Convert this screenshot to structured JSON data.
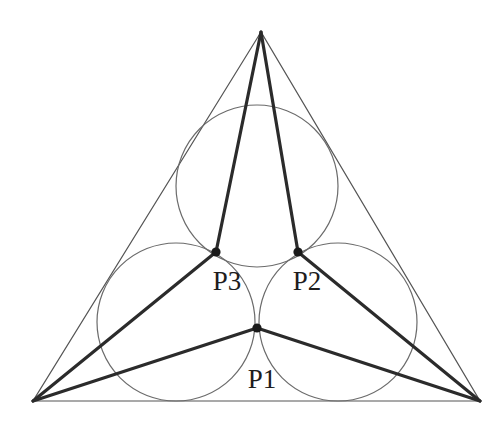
{
  "figure": {
    "canvas": {
      "width": 501,
      "height": 424,
      "background": "#ffffff"
    },
    "colors": {
      "thin_outline": "#555555",
      "circle_stroke": "#6b6b6b",
      "thick_segment": "#2b2b2b",
      "point_fill": "#1a1a1a",
      "label_text": "#1d1d1d"
    },
    "stroke_widths": {
      "thin_outline": 1.2,
      "circle": 1.2,
      "thick_segment": 3.2
    },
    "triangle": {
      "name": "outer-triangle",
      "vertices": [
        {
          "name": "apex",
          "x": 261,
          "y": 32
        },
        {
          "name": "bottom-left",
          "x": 33,
          "y": 401
        },
        {
          "name": "bottom-right",
          "x": 480,
          "y": 401
        }
      ]
    },
    "circles": [
      {
        "name": "top-circle",
        "cx": 257,
        "cy": 186,
        "r": 81
      },
      {
        "name": "bottom-left-circle",
        "cx": 176,
        "cy": 322,
        "r": 79
      },
      {
        "name": "bottom-right-circle",
        "cx": 338,
        "cy": 322,
        "r": 79
      }
    ],
    "points": [
      {
        "id": "P1",
        "label": "P1",
        "x": 257,
        "y": 328,
        "radius": 4.6,
        "label_x": 262,
        "label_y": 388
      },
      {
        "id": "P2",
        "label": "P2",
        "x": 298,
        "y": 252,
        "radius": 4.6,
        "label_x": 307,
        "label_y": 290
      },
      {
        "id": "P3",
        "label": "P3",
        "x": 216,
        "y": 252,
        "radius": 4.6,
        "label_x": 227,
        "label_y": 290
      }
    ],
    "thick_segments": [
      {
        "name": "apex-to-P3",
        "x1": 261,
        "y1": 32,
        "x2": 216,
        "y2": 252
      },
      {
        "name": "apex-to-P2",
        "x1": 261,
        "y1": 32,
        "x2": 298,
        "y2": 252
      },
      {
        "name": "bottom-left-to-P3",
        "x1": 33,
        "y1": 401,
        "x2": 216,
        "y2": 252
      },
      {
        "name": "bottom-left-to-P1",
        "x1": 33,
        "y1": 401,
        "x2": 257,
        "y2": 328
      },
      {
        "name": "bottom-right-to-P2",
        "x1": 480,
        "y1": 401,
        "x2": 298,
        "y2": 252
      },
      {
        "name": "bottom-right-to-P1",
        "x1": 480,
        "y1": 401,
        "x2": 257,
        "y2": 328
      }
    ]
  },
  "chart_data": {
    "type": "scatter",
    "title": "",
    "xlabel": "",
    "ylabel": "",
    "xlim": [
      0,
      501
    ],
    "ylim": [
      424,
      0
    ],
    "grid": false,
    "legend": "none",
    "annotations": [
      "P1",
      "P2",
      "P3"
    ],
    "series": [
      {
        "name": "tangency-points",
        "x": [
          257,
          298,
          216
        ],
        "y": [
          328,
          252,
          252
        ],
        "labels": [
          "P1",
          "P2",
          "P3"
        ]
      }
    ],
    "shapes": {
      "triangle_vertices": [
        [
          261,
          32
        ],
        [
          33,
          401
        ],
        [
          480,
          401
        ]
      ],
      "circles": [
        {
          "cx": 257,
          "cy": 186,
          "r": 81
        },
        {
          "cx": 176,
          "cy": 322,
          "r": 79
        },
        {
          "cx": 338,
          "cy": 322,
          "r": 79
        }
      ],
      "segments": [
        [
          [
            261,
            32
          ],
          [
            216,
            252
          ]
        ],
        [
          [
            261,
            32
          ],
          [
            298,
            252
          ]
        ],
        [
          [
            33,
            401
          ],
          [
            216,
            252
          ]
        ],
        [
          [
            33,
            401
          ],
          [
            257,
            328
          ]
        ],
        [
          [
            480,
            401
          ],
          [
            298,
            252
          ]
        ],
        [
          [
            480,
            401
          ],
          [
            257,
            328
          ]
        ]
      ]
    }
  }
}
